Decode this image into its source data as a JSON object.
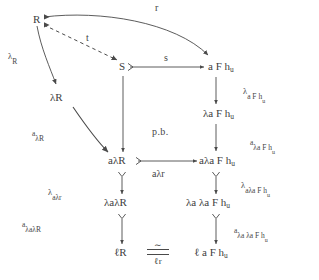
{
  "figure": {
    "type": "commutative-diagram",
    "background": "#ffffff",
    "ink": "#404040"
  },
  "nodes": [
    {
      "id": "R",
      "text": "R",
      "x": 33,
      "y": 14
    },
    {
      "id": "S",
      "text": "S",
      "x": 119,
      "y": 66
    },
    {
      "id": "aFhu",
      "text": "a F h",
      "sub": "u",
      "x": 208,
      "y": 66
    },
    {
      "id": "lamR",
      "text": "λR",
      "x": 50,
      "y": 92
    },
    {
      "id": "lamaFhu",
      "text": "λa F h",
      "sub": "u",
      "x": 205,
      "y": 113
    },
    {
      "id": "alamR",
      "text": "aλR",
      "x": 113,
      "y": 160
    },
    {
      "id": "alamaFhu",
      "text": "aλa F h",
      "sub": "u",
      "x": 201,
      "y": 160
    },
    {
      "id": "lamalamR",
      "text": "λaλR",
      "x": 106,
      "y": 202
    },
    {
      "id": "lamalamaFhu",
      "text": "λa λa F h",
      "sub": "u",
      "x": 189,
      "y": 202
    },
    {
      "id": "ellR",
      "text": "ℓR",
      "x": 117,
      "y": 252
    },
    {
      "id": "ellaFhu",
      "text": "ℓ a F h",
      "sub": "u",
      "x": 197,
      "y": 252
    }
  ],
  "edge_labels": [
    {
      "id": "r",
      "text": "r",
      "x": 155,
      "y": 4,
      "style": "plain"
    },
    {
      "id": "t",
      "text": "t",
      "x": 86,
      "y": 36,
      "style": "plain"
    },
    {
      "id": "s",
      "text": "s",
      "x": 164,
      "y": 58,
      "style": "plain"
    },
    {
      "id": "lamR-label",
      "kind": "lam-sub",
      "base": "λ",
      "sub": "R",
      "x": 8,
      "y": 53
    },
    {
      "id": "a-lamR-label",
      "kind": "sup-sub",
      "sup": "a",
      "sub": "λR",
      "x": 32,
      "y": 131
    },
    {
      "id": "lam-a-F-hu-label",
      "kind": "lam-sub-complex",
      "base": "λ",
      "sub": "a F h",
      "subsub": "u",
      "x": 243,
      "y": 88
    },
    {
      "id": "a-lama-F-hu-label",
      "kind": "sup-sub-complex",
      "sup": "a",
      "sub": "λa F h",
      "subsub": "u",
      "x": 252,
      "y": 140
    },
    {
      "id": "alamr-label",
      "text": "aλr",
      "x": 152,
      "y": 171,
      "style": "plain"
    },
    {
      "id": "lam-alamr-label",
      "kind": "lam-sub",
      "base": "λ",
      "sub": "aλr",
      "x": 48,
      "y": 189
    },
    {
      "id": "lam-alama-F-hu-label",
      "kind": "lam-sub-complex",
      "base": "λ",
      "sub": "aλa F h",
      "subsub": "u",
      "x": 243,
      "y": 182
    },
    {
      "id": "a-lamalamR-label",
      "kind": "sup-sub",
      "sup": "a",
      "sub": "λaλR",
      "x": 22,
      "y": 222
    },
    {
      "id": "a-lama-lama-F-hu-label",
      "kind": "sup-sub-complex",
      "sup": "a",
      "sub": "λa λa F h",
      "subsub": "u",
      "x": 236,
      "y": 228
    },
    {
      "id": "pb",
      "text": "p.b.",
      "x": 152,
      "y": 128,
      "style": "plain"
    }
  ],
  "iso": {
    "id": "iso-ell-r",
    "tilde": "∼",
    "denominator": "ℓr",
    "x": 147,
    "y": 244
  },
  "arrows": [
    {
      "id": "arrow-r",
      "from": "R",
      "to": "aFhu",
      "kind": "curved",
      "label": "r"
    },
    {
      "id": "arrow-t",
      "from": "R",
      "to": "S",
      "kind": "dashed",
      "label": "t"
    },
    {
      "id": "arrow-lamR",
      "from": "R",
      "to": "lamR",
      "kind": "curved",
      "label": "lamR-label"
    },
    {
      "id": "arrow-s",
      "from": "S",
      "to": "aFhu",
      "kind": "mono",
      "label": "s"
    },
    {
      "id": "arrow-a-lamR",
      "from": "lamR",
      "to": "alamR",
      "kind": "curved",
      "label": "a-lamR-label"
    },
    {
      "id": "arrow-S-alamR",
      "from": "S",
      "to": "alamR",
      "kind": "straight",
      "label": ""
    },
    {
      "id": "arrow-lam-a-F-hu",
      "from": "aFhu",
      "to": "lamaFhu",
      "kind": "straight",
      "label": "lam-a-F-hu-label"
    },
    {
      "id": "arrow-a-lama-F-hu",
      "from": "lamaFhu",
      "to": "alamaFhu",
      "kind": "straight",
      "label": "a-lama-F-hu-label"
    },
    {
      "id": "arrow-alamr",
      "from": "alamR",
      "to": "alamaFhu",
      "kind": "mono",
      "label": "alamr-label"
    },
    {
      "id": "arrow-lam-alamr",
      "from": "alamR",
      "to": "lamalamR",
      "kind": "mono-v",
      "label": "lam-alamr-label"
    },
    {
      "id": "arrow-lam-alama",
      "from": "alamaFhu",
      "to": "lamalamaFhu",
      "kind": "mono-v",
      "label": "lam-alama-F-hu-label"
    },
    {
      "id": "arrow-a-lamalamR",
      "from": "lamalamR",
      "to": "ellR",
      "kind": "mono-v",
      "label": "a-lamalamR-label"
    },
    {
      "id": "arrow-a-lama-lama",
      "from": "lamalamaFhu",
      "to": "ellaFhu",
      "kind": "mono-v",
      "label": "a-lama-lama-F-hu-label"
    }
  ]
}
